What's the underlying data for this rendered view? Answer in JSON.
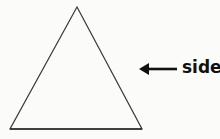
{
  "diagram": {
    "shape": "triangle",
    "vertices": {
      "apex": [
        77,
        7
      ],
      "bottom_left": [
        10,
        129
      ],
      "bottom_right": [
        142,
        129
      ]
    },
    "stroke_color": "#3a3a3a",
    "arrow": {
      "from": [
        177,
        69
      ],
      "to": [
        139,
        69
      ],
      "color": "#111111",
      "direction": "left"
    },
    "label": "side"
  }
}
